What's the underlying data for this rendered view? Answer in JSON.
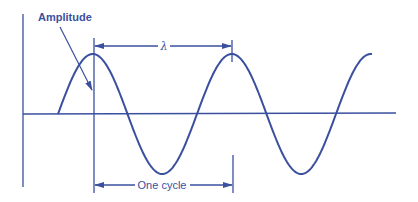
{
  "diagram": {
    "labels": {
      "amplitude": "Amplitude",
      "wavelength": "λ",
      "one_cycle": "One cycle"
    },
    "colors": {
      "stroke": "#3a4f9e",
      "background": "#ffffff"
    },
    "geometry": {
      "axis_y": 114,
      "axis_x_start": 23,
      "axis_x_end": 396,
      "y_axis_top": 14,
      "y_axis_bottom": 187,
      "wave_start_x": 58,
      "wave_end_x": 372,
      "period_px": 139,
      "amplitude_px": 60,
      "peak1_x": 93,
      "peak2_x": 232,
      "trough1_x": 163,
      "trough2_x": 302
    }
  }
}
